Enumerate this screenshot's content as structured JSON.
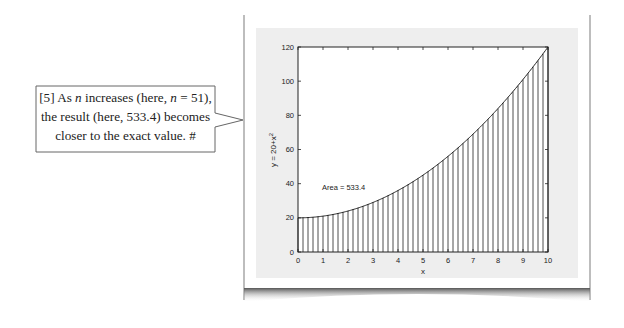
{
  "callout": {
    "lines": [
      {
        "parts": [
          "[5] As ",
          "n",
          " increases (here, ",
          "n",
          " = 51),"
        ]
      },
      {
        "parts": [
          "the result (here, 533.4) becomes"
        ]
      },
      {
        "parts": [
          "closer to the exact value.  #"
        ]
      }
    ],
    "line1_a": "[5] As ",
    "line1_n1": "n",
    "line1_b": " increases (here, ",
    "line1_n2": "n",
    "line1_c": " = 51),",
    "line2": "the result (here, 533.4) becomes",
    "line3": "closer to the exact value.  #"
  },
  "chart_data": {
    "type": "area",
    "title": "",
    "xlabel": "x",
    "ylabel": "y = 20+x^2",
    "ylabel_base": "y = 20+x",
    "ylabel_sup": "2",
    "xlim": [
      0,
      10
    ],
    "ylim": [
      0,
      120
    ],
    "x_ticks": [
      "0",
      "1",
      "2",
      "3",
      "4",
      "5",
      "6",
      "7",
      "8",
      "9",
      "10"
    ],
    "y_ticks": [
      "0",
      "20",
      "40",
      "60",
      "80",
      "100",
      "120"
    ],
    "function": "y = 20 + x^2",
    "n": 51,
    "annotation": "Area = 533.4",
    "grid": false,
    "series": [
      {
        "name": "y = 20+x^2",
        "x": [
          0,
          1,
          2,
          3,
          4,
          5,
          6,
          7,
          8,
          9,
          10
        ],
        "values": [
          20,
          21,
          24,
          29,
          36,
          45,
          56,
          69,
          84,
          101,
          120
        ]
      }
    ]
  }
}
